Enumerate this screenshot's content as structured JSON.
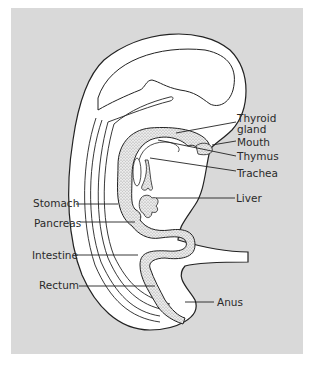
{
  "figure": {
    "background_color": "#d9d9d9",
    "outline_color": "#222222",
    "tissue_fill": "#ffffff",
    "endoderm_stipple_color": "#b8b8b8"
  },
  "labels": {
    "thyroid_line1": "Thyroid",
    "thyroid_line2": "gland",
    "mouth": "Mouth",
    "thymus": "Thymus",
    "trachea": "Trachea",
    "liver": "Liver",
    "stomach": "Stomach",
    "pancreas": "Pancreas",
    "intestine": "Intestine",
    "rectum": "Rectum",
    "anus": "Anus"
  }
}
